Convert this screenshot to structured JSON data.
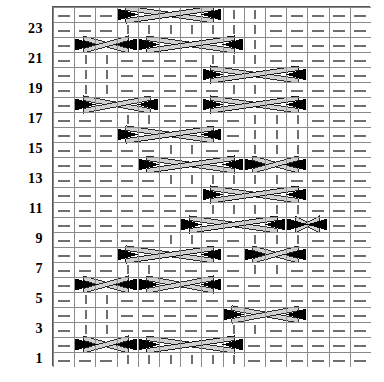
{
  "chart_type": "knitting-cable-chart",
  "title": "",
  "grid": {
    "columns": 15,
    "rows": 24,
    "cell_width": 21.2,
    "cell_height": 15,
    "origin_x": 52,
    "origin_y": 6,
    "border_color": "#555555",
    "gridline_color": "#8a8a8a",
    "background": "#ffffff",
    "symbol_color": "#6f6f6f",
    "cable_fill": "#000000",
    "cable_band": "#d0d0d0",
    "cable_band_edge": "#000000"
  },
  "row_labels": {
    "visible_rows": [
      1,
      3,
      5,
      7,
      9,
      11,
      13,
      15,
      17,
      19,
      21,
      23
    ],
    "labels": [
      "23",
      "21",
      "19",
      "17",
      "15",
      "13",
      "11",
      "9",
      "7",
      "5",
      "3",
      "1"
    ],
    "color": "#000000"
  },
  "legend": {
    "dash": "purl-stitch-dash",
    "bar": "knit-stitch-bar",
    "triangle": "cable-cross-triangle"
  },
  "chart_data": {
    "type": "heatmap",
    "xlabel": "",
    "ylabel": "Row",
    "grid": true,
    "legend_position": "none",
    "categories": [
      "1",
      "2",
      "3",
      "4",
      "5",
      "6",
      "7",
      "8",
      "9",
      "10",
      "11",
      "12",
      "13",
      "14",
      "15"
    ],
    "rows": [
      {
        "row": 24,
        "cells": [
          "dash",
          "dash",
          "dash",
          "cableL",
          "cross",
          "cross",
          "cross",
          "cableR",
          "bar",
          "bar",
          "dash",
          "dash",
          "dash",
          "dash",
          "dash"
        ]
      },
      {
        "row": 23,
        "cells": [
          "dash",
          "dash",
          "dash",
          "bar",
          "bar",
          "bar",
          "bar",
          "bar",
          "bar",
          "bar",
          "dash",
          "dash",
          "dash",
          "dash",
          "dash"
        ]
      },
      {
        "row": 22,
        "cells": [
          "dash",
          "cableL",
          "cross",
          "cross",
          "cableR",
          "cross",
          "cross",
          "cross",
          "cableR",
          "bar",
          "dash",
          "dash",
          "dash",
          "dash",
          "dash"
        ]
      },
      {
        "row": 21,
        "cells": [
          "dash",
          "bar",
          "bar",
          "dash",
          "dash",
          "dash",
          "dash",
          "bar",
          "bar",
          "bar",
          "dash",
          "dash",
          "dash",
          "dash",
          "dash"
        ]
      },
      {
        "row": 20,
        "cells": [
          "dash",
          "bar",
          "bar",
          "dash",
          "dash",
          "dash",
          "dash",
          "cableL",
          "cross",
          "cross",
          "cross",
          "cableR",
          "dash",
          "dash",
          "dash"
        ]
      },
      {
        "row": 19,
        "cells": [
          "dash",
          "bar",
          "bar",
          "dash",
          "dash",
          "dash",
          "dash",
          "dash",
          "bar",
          "bar",
          "dash",
          "dash",
          "dash",
          "dash",
          "dash"
        ]
      },
      {
        "row": 18,
        "cells": [
          "dash",
          "cableL",
          "cross",
          "cross",
          "cableR",
          "dash",
          "dash",
          "cableL",
          "cross",
          "cross",
          "cross",
          "cableR",
          "dash",
          "dash",
          "dash"
        ]
      },
      {
        "row": 17,
        "cells": [
          "dash",
          "dash",
          "dash",
          "bar",
          "bar",
          "dash",
          "dash",
          "dash",
          "dash",
          "bar",
          "bar",
          "bar",
          "dash",
          "dash",
          "dash"
        ]
      },
      {
        "row": 16,
        "cells": [
          "dash",
          "dash",
          "dash",
          "cableL",
          "cross",
          "cross",
          "cross",
          "cableR",
          "dash",
          "bar",
          "bar",
          "bar",
          "dash",
          "dash",
          "dash"
        ]
      },
      {
        "row": 15,
        "cells": [
          "dash",
          "dash",
          "dash",
          "dash",
          "dash",
          "bar",
          "bar",
          "dash",
          "dash",
          "bar",
          "bar",
          "bar",
          "dash",
          "dash",
          "dash"
        ]
      },
      {
        "row": 14,
        "cells": [
          "dash",
          "dash",
          "dash",
          "dash",
          "cableL",
          "cross",
          "cross",
          "cross",
          "cableR",
          "cross",
          "cross",
          "cableR",
          "dash",
          "dash",
          "dash"
        ]
      },
      {
        "row": 13,
        "cells": [
          "dash",
          "dash",
          "dash",
          "dash",
          "dash",
          "bar",
          "bar",
          "bar",
          "bar",
          "bar",
          "bar",
          "dash",
          "dash",
          "dash",
          "dash"
        ]
      },
      {
        "row": 12,
        "cells": [
          "dash",
          "dash",
          "dash",
          "dash",
          "dash",
          "dash",
          "dash",
          "cableL",
          "cross",
          "cross",
          "cross",
          "cableR",
          "dash",
          "dash",
          "dash"
        ]
      },
      {
        "row": 11,
        "cells": [
          "dash",
          "dash",
          "dash",
          "dash",
          "dash",
          "dash",
          "dash",
          "bar",
          "bar",
          "bar",
          "bar",
          "bar",
          "dash",
          "dash",
          "dash"
        ]
      },
      {
        "row": 10,
        "cells": [
          "dash",
          "dash",
          "dash",
          "dash",
          "dash",
          "dash",
          "cableL",
          "cross",
          "cross",
          "cross",
          "cableR",
          "cross",
          "cableR",
          "dash",
          "dash"
        ]
      },
      {
        "row": 9,
        "cells": [
          "dash",
          "dash",
          "dash",
          "dash",
          "dash",
          "bar",
          "bar",
          "dash",
          "dash",
          "bar",
          "bar",
          "bar",
          "dash",
          "dash",
          "dash"
        ]
      },
      {
        "row": 8,
        "cells": [
          "dash",
          "dash",
          "dash",
          "cableL",
          "cross",
          "cross",
          "cross",
          "cableR",
          "dash",
          "cableL",
          "cross",
          "cableR",
          "dash",
          "dash",
          "dash"
        ]
      },
      {
        "row": 7,
        "cells": [
          "dash",
          "dash",
          "dash",
          "bar",
          "bar",
          "dash",
          "dash",
          "dash",
          "dash",
          "bar",
          "bar",
          "dash",
          "dash",
          "dash",
          "dash"
        ]
      },
      {
        "row": 6,
        "cells": [
          "dash",
          "cableL",
          "cross",
          "cross",
          "cableR",
          "cross",
          "cross",
          "cableR",
          "dash",
          "dash",
          "dash",
          "dash",
          "dash",
          "dash",
          "dash"
        ]
      },
      {
        "row": 5,
        "cells": [
          "dash",
          "bar",
          "bar",
          "dash",
          "dash",
          "dash",
          "dash",
          "dash",
          "dash",
          "dash",
          "dash",
          "dash",
          "dash",
          "dash",
          "dash"
        ]
      },
      {
        "row": 4,
        "cells": [
          "dash",
          "bar",
          "bar",
          "dash",
          "dash",
          "dash",
          "dash",
          "dash",
          "cableL",
          "cross",
          "cross",
          "cableR",
          "dash",
          "dash",
          "dash"
        ]
      },
      {
        "row": 3,
        "cells": [
          "dash",
          "bar",
          "bar",
          "dash",
          "dash",
          "dash",
          "dash",
          "dash",
          "bar",
          "bar",
          "dash",
          "dash",
          "dash",
          "dash",
          "dash"
        ]
      },
      {
        "row": 2,
        "cells": [
          "dash",
          "cableL",
          "cross",
          "cross",
          "cableL",
          "cross",
          "cross",
          "cross",
          "cableR",
          "dash",
          "dash",
          "dash",
          "dash",
          "dash",
          "dash"
        ]
      },
      {
        "row": 1,
        "cells": [
          "dash",
          "dash",
          "dash",
          "bar",
          "bar",
          "bar",
          "bar",
          "bar",
          "bar",
          "dash",
          "dash",
          "dash",
          "dash",
          "dash",
          "dash"
        ]
      }
    ],
    "cables": [
      {
        "row": 24,
        "left": 3,
        "right": 8,
        "style": "double-cross"
      },
      {
        "row": 22,
        "left": 1,
        "right": 4,
        "style": "cross"
      },
      {
        "row": 22,
        "left": 4,
        "right": 9,
        "style": "double-cross"
      },
      {
        "row": 20,
        "left": 7,
        "right": 12,
        "style": "double-cross"
      },
      {
        "row": 18,
        "left": 1,
        "right": 5,
        "style": "cross"
      },
      {
        "row": 18,
        "left": 7,
        "right": 12,
        "style": "double-cross"
      },
      {
        "row": 16,
        "left": 3,
        "right": 8,
        "style": "double-cross"
      },
      {
        "row": 14,
        "left": 4,
        "right": 9,
        "style": "double-cross"
      },
      {
        "row": 14,
        "left": 9,
        "right": 12,
        "style": "cross"
      },
      {
        "row": 12,
        "left": 7,
        "right": 12,
        "style": "double-cross"
      },
      {
        "row": 10,
        "left": 6,
        "right": 11,
        "style": "double-cross"
      },
      {
        "row": 10,
        "left": 11,
        "right": 13,
        "style": "cross"
      },
      {
        "row": 8,
        "left": 3,
        "right": 8,
        "style": "double-cross"
      },
      {
        "row": 8,
        "left": 9,
        "right": 12,
        "style": "cross"
      },
      {
        "row": 6,
        "left": 1,
        "right": 4,
        "style": "cross"
      },
      {
        "row": 6,
        "left": 4,
        "right": 8,
        "style": "cross"
      },
      {
        "row": 4,
        "left": 8,
        "right": 12,
        "style": "cross"
      },
      {
        "row": 2,
        "left": 1,
        "right": 4,
        "style": "cross"
      },
      {
        "row": 2,
        "left": 4,
        "right": 9,
        "style": "double-cross"
      }
    ],
    "symbol_map": {
      "dash": "horizontal dash (purl)",
      "bar": "vertical bar (knit)",
      "cableL": "left cable triangle",
      "cableR": "right cable triangle",
      "cross": "cable crossing band"
    }
  }
}
